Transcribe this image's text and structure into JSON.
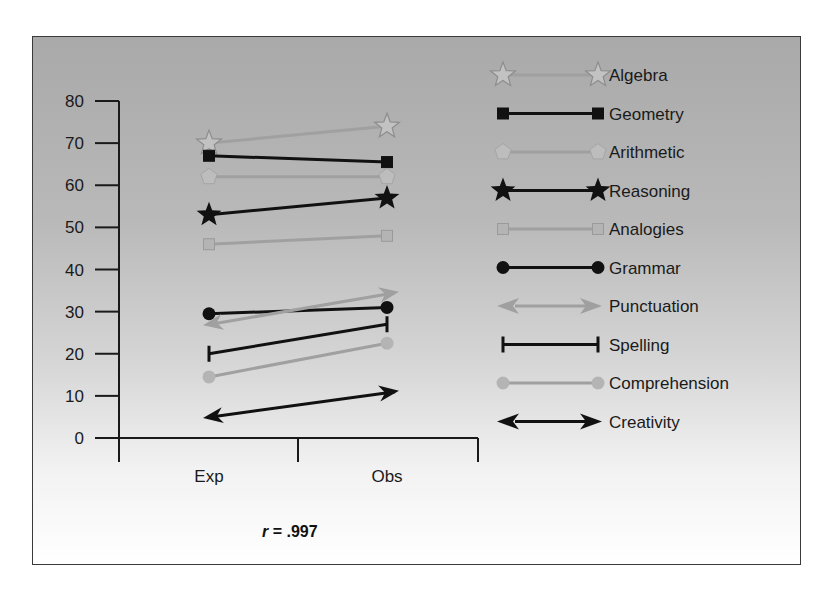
{
  "chart_data": {
    "type": "line",
    "title": "",
    "xlabel": "",
    "ylabel": "",
    "categories": [
      "Exp",
      "Obs"
    ],
    "ylim": [
      0,
      80
    ],
    "yticks": [
      0,
      10,
      20,
      30,
      40,
      50,
      60,
      70,
      80
    ],
    "grid": false,
    "legend_position": "right",
    "annotation": "r = .997",
    "series": [
      {
        "name": "Algebra",
        "values": [
          70,
          74
        ],
        "marker": "star-outline",
        "color": "#9a9a9a"
      },
      {
        "name": "Geometry",
        "values": [
          67,
          65.5
        ],
        "marker": "square",
        "color": "#111111"
      },
      {
        "name": "Arithmetic",
        "values": [
          62,
          62
        ],
        "marker": "pentagon",
        "color": "#9a9a9a"
      },
      {
        "name": "Reasoning",
        "values": [
          53,
          57
        ],
        "marker": "star",
        "color": "#111111"
      },
      {
        "name": "Analogies",
        "values": [
          46,
          48
        ],
        "marker": "square",
        "color": "#9a9a9a"
      },
      {
        "name": "Grammar",
        "values": [
          29.5,
          31
        ],
        "marker": "circle",
        "color": "#111111"
      },
      {
        "name": "Punctuation",
        "values": [
          27,
          34.5
        ],
        "marker": "double-arrow",
        "color": "#9a9a9a"
      },
      {
        "name": "Spelling",
        "values": [
          20,
          27
        ],
        "marker": "bar-end",
        "color": "#111111"
      },
      {
        "name": "Comprehension",
        "values": [
          14.5,
          22.5
        ],
        "marker": "circle",
        "color": "#9a9a9a"
      },
      {
        "name": "Creativity",
        "values": [
          5,
          11
        ],
        "marker": "double-arrow",
        "color": "#111111"
      }
    ]
  },
  "annotation": {
    "r_symbol": "r",
    "r_value": " = .997"
  },
  "axis": {
    "y_ticks": [
      "0",
      "10",
      "20",
      "30",
      "40",
      "50",
      "60",
      "70",
      "80"
    ],
    "x_categories": [
      "Exp",
      "Obs"
    ]
  },
  "legend": {
    "items": [
      "Algebra",
      "Geometry",
      "Arithmetic",
      "Reasoning",
      "Analogies",
      "Grammar",
      "Punctuation",
      "Spelling",
      "Comprehension",
      "Creativity"
    ]
  }
}
